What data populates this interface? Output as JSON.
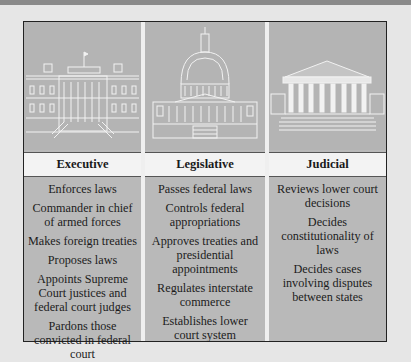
{
  "columns": [
    {
      "title": "Executive",
      "illustration": "white-house",
      "items": [
        "Enforces laws",
        "Commander in chief of armed forces",
        "Makes foreign treaties",
        "Proposes laws",
        "Appoints Supreme Court justices and federal court judges",
        "Pardons those convicted in federal court"
      ]
    },
    {
      "title": "Legislative",
      "illustration": "capitol-building",
      "items": [
        "Passes federal laws",
        "Controls federal appropriations",
        "Approves treaties and presidential appointments",
        "Regulates interstate commerce",
        "Establishes lower court system"
      ]
    },
    {
      "title": "Judicial",
      "illustration": "supreme-court-building",
      "items": [
        "Reviews lower court decisions",
        "Decides constitutionality of laws",
        "Decides cases involving disputes between states"
      ]
    }
  ],
  "colors": {
    "background": "#e6e6e6",
    "panel": "#b9b9b9",
    "header": "#f3f3f3",
    "border": "#222222",
    "line_art": "#f2f2f2"
  }
}
